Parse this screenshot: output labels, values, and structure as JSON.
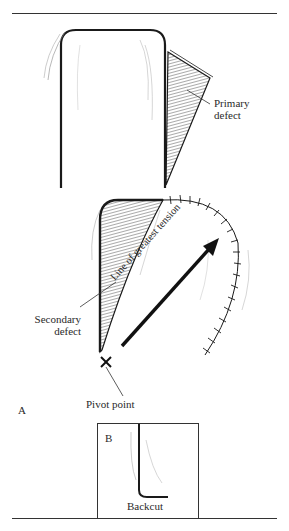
{
  "figure": {
    "labels": {
      "primary_defect_line1": "Primary",
      "primary_defect_line2": "defect",
      "secondary_defect_line1": "Secondary",
      "secondary_defect_line2": "defect",
      "tension_line": "Line of greatest tension",
      "pivot_point": "Pivot point",
      "panel_a": "A",
      "panel_b": "B",
      "backcut": "Backcut"
    },
    "colors": {
      "ink": "#1a1a1a",
      "hatch": "#555555",
      "background": "#ffffff"
    }
  }
}
